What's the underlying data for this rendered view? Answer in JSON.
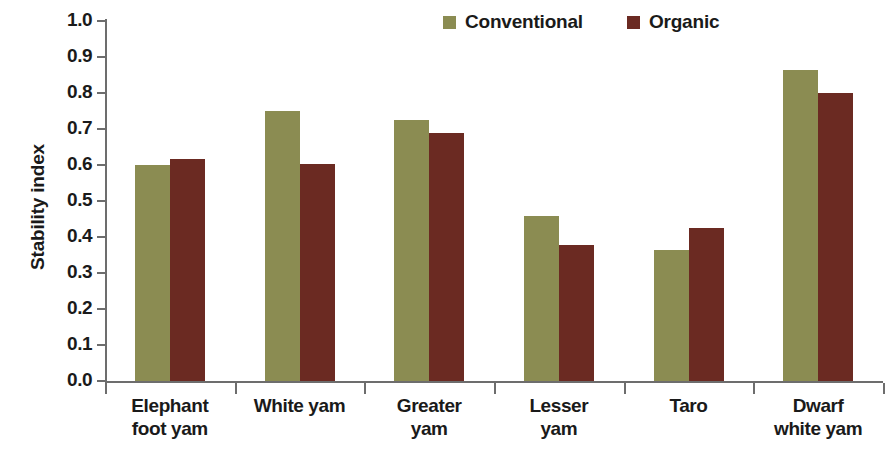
{
  "chart_data": {
    "type": "bar",
    "title": "",
    "xlabel": "",
    "ylabel": "Stability index",
    "ylim": [
      0.0,
      1.0
    ],
    "ytick_step": 0.1,
    "grid": false,
    "legend_position": "top-right",
    "categories": [
      "Elephant foot yam",
      "White yam",
      "Greater yam",
      "Lesser yam",
      "Taro",
      "Dwarf white yam"
    ],
    "category_lines": [
      [
        "Elephant",
        "foot yam"
      ],
      [
        "White yam",
        ""
      ],
      [
        "Greater",
        "yam"
      ],
      [
        "Lesser",
        "yam"
      ],
      [
        "Taro",
        ""
      ],
      [
        "Dwarf",
        "white yam"
      ]
    ],
    "ytick_labels": [
      "1.0",
      "0.9",
      "0.8",
      "0.7",
      "0.6",
      "0.5",
      "0.4",
      "0.3",
      "0.2",
      "0.1",
      "0.0"
    ],
    "ytick_values": [
      1.0,
      0.9,
      0.8,
      0.7,
      0.6,
      0.5,
      0.4,
      0.3,
      0.2,
      0.1,
      0.0
    ],
    "series": [
      {
        "name": "Conventional",
        "color": "#8b8c52",
        "values": [
          0.6,
          0.75,
          0.726,
          0.457,
          0.363,
          0.865
        ]
      },
      {
        "name": "Organic",
        "color": "#6b2a22",
        "values": [
          0.617,
          0.602,
          0.69,
          0.378,
          0.425,
          0.8
        ]
      }
    ]
  },
  "legend": {
    "entries": [
      {
        "label": "Conventional",
        "color": "#8b8c52",
        "swatch": "legend-swatch-conventional"
      },
      {
        "label": "Organic",
        "color": "#6b2a22",
        "swatch": "legend-swatch-organic"
      }
    ]
  },
  "axis": {
    "y_title": "Stability index"
  }
}
